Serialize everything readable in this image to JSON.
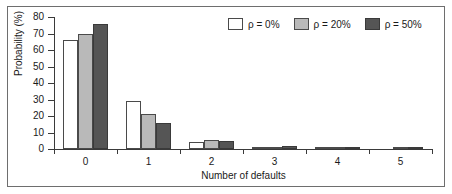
{
  "chart_data": {
    "type": "bar",
    "title": "",
    "xlabel": "Number of defaults",
    "ylabel": "Probability (%)",
    "categories": [
      "0",
      "1",
      "2",
      "3",
      "4",
      "5"
    ],
    "series": [
      {
        "name": "ρ = 0%",
        "color": "#ffffff",
        "values": [
          66,
          29,
          4,
          0.4,
          0.1,
          0.0
        ]
      },
      {
        "name": "ρ = 20%",
        "color": "#b9b9b9",
        "values": [
          70,
          21,
          5.5,
          1.0,
          0.2,
          0.05
        ]
      },
      {
        "name": "ρ = 50%",
        "color": "#555555",
        "values": [
          76,
          15.5,
          5,
          1.6,
          1.0,
          0.5
        ]
      }
    ],
    "ylim": [
      0,
      80
    ],
    "yticks": [
      "0",
      "10",
      "20",
      "30",
      "40",
      "50",
      "60",
      "70",
      "80"
    ],
    "grid": false,
    "legend_position": "top-right"
  },
  "legend": {
    "entries": [
      {
        "label": "ρ = 0%"
      },
      {
        "label": "ρ = 20%"
      },
      {
        "label": "ρ = 50%"
      }
    ]
  }
}
